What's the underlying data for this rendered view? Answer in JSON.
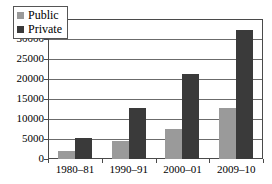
{
  "chart_data": {
    "type": "bar",
    "title": "",
    "subtitle": "",
    "xlabel": "",
    "ylabel": "",
    "categories": [
      "1980–81",
      "1990–91",
      "2000–01",
      "2009–10"
    ],
    "series": [
      {
        "name": "Public",
        "values": [
          2000,
          4500,
          7400,
          12700
        ],
        "color": "#9a9a9a"
      },
      {
        "name": "Private",
        "values": [
          5200,
          12800,
          21300,
          32200
        ],
        "color": "#3a3a3a"
      }
    ],
    "ylim": [
      0,
      35000
    ],
    "yticks": [
      0,
      5000,
      10000,
      15000,
      20000,
      25000,
      30000,
      35000
    ],
    "ytick_labels": [
      "0",
      "5000",
      "10000",
      "15000",
      "20000",
      "25000",
      "30000",
      "35000"
    ],
    "grid": true,
    "grid_axis": "y",
    "legend": {
      "position": "top-left-inside",
      "entries": [
        {
          "label": "Public",
          "swatch": "legend-swatch-public"
        },
        {
          "label": "Private",
          "swatch": "legend-swatch-private"
        }
      ]
    },
    "plot_border": true,
    "background_color": "#ffffff",
    "axis_color": "#4a4a4a"
  }
}
